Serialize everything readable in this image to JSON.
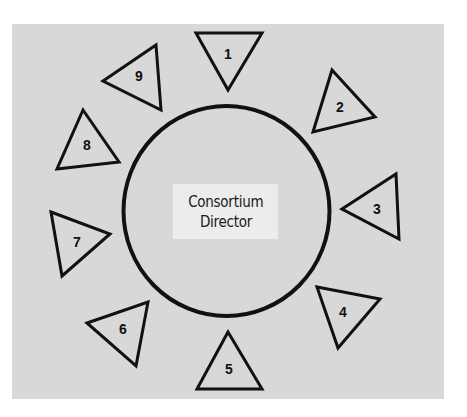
{
  "diagram": {
    "type": "hub-and-spoke",
    "hub": {
      "label_lines": [
        "Consortium",
        "Director"
      ]
    },
    "members": [
      {
        "number": "1",
        "points": "196,33 262,33 228,90",
        "label_x": 228,
        "label_y": 54
      },
      {
        "number": "2",
        "points": "332,70 375,117 313,132",
        "label_x": 340,
        "label_y": 107
      },
      {
        "number": "3",
        "points": "342,209 396,174 399,239",
        "label_x": 377,
        "label_y": 209
      },
      {
        "number": "4",
        "points": "317,287 380,299 338,348",
        "label_x": 343,
        "label_y": 312
      },
      {
        "number": "5",
        "points": "228,332 197,389 262,389",
        "label_x": 229,
        "label_y": 369
      },
      {
        "number": "6",
        "points": "87,323 148,302 136,366",
        "label_x": 123,
        "label_y": 329
      },
      {
        "number": "7",
        "points": "51,212 110,234 62,276",
        "label_x": 77,
        "label_y": 242
      },
      {
        "number": "8",
        "points": "83,110 57,169 119,162",
        "label_x": 87,
        "label_y": 145
      },
      {
        "number": "9",
        "points": "103,81 156,45 161,110",
        "label_x": 139,
        "label_y": 76
      }
    ]
  }
}
